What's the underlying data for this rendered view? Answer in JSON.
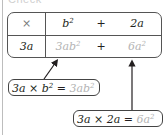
{
  "heading": "Check",
  "table": {
    "header_row": {
      "operator": "×",
      "term1": {
        "base": "b",
        "exp": "2"
      },
      "plus": "+",
      "term2": "2a"
    },
    "body_row": {
      "multiplier": "3a",
      "product1": {
        "base": "3ab",
        "exp": "2"
      },
      "plus": "+",
      "product2": {
        "base": "6a",
        "exp": "2"
      }
    }
  },
  "callouts": [
    {
      "lhs": "3a × b",
      "lhs_exp": "2",
      "eq": " = ",
      "rhs": "3ab",
      "rhs_exp": "2"
    },
    {
      "lhs": "3a × 2a",
      "eq": " = ",
      "rhs": "6a",
      "rhs_exp": "2"
    }
  ],
  "colors": {
    "text": "#231f20",
    "faded": "#b4b4b4",
    "border": "#555555"
  }
}
